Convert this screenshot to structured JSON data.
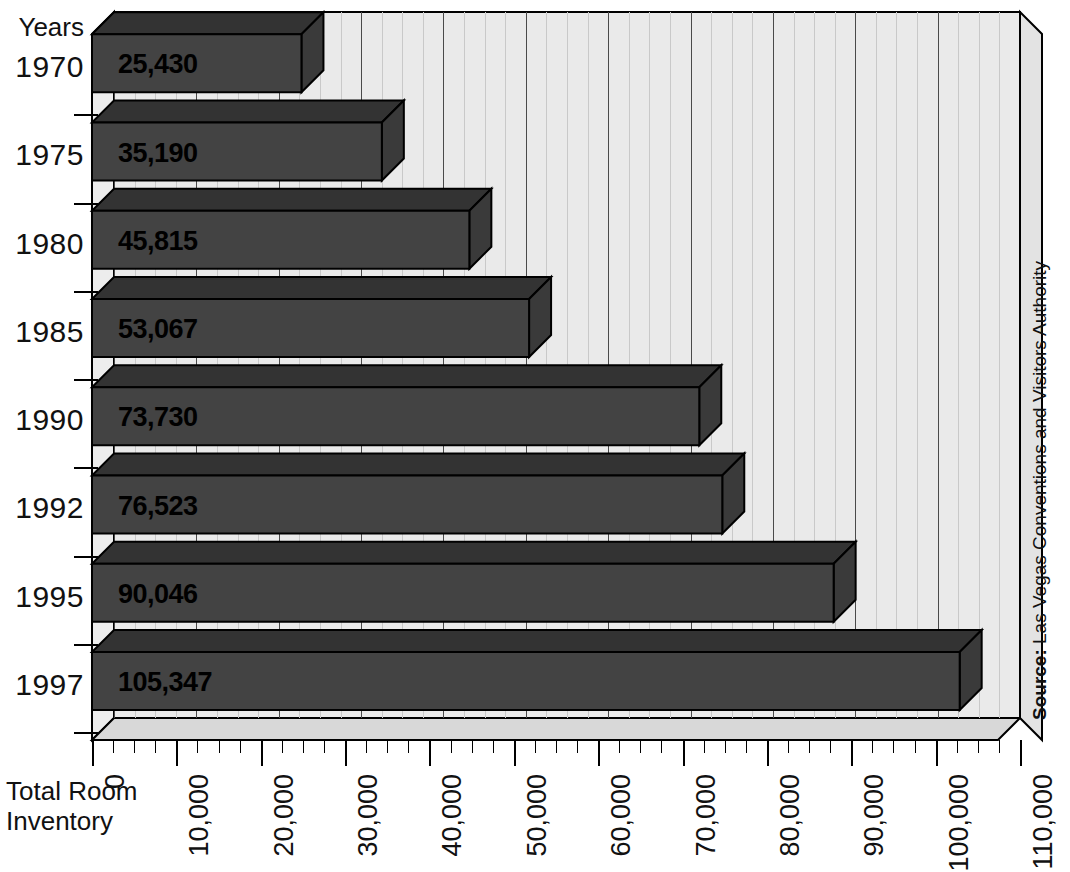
{
  "chart_data": {
    "type": "bar",
    "orientation": "horizontal",
    "title": "",
    "xlabel": "Total Room Inventory",
    "ylabel": "Years",
    "categories": [
      "1970",
      "1975",
      "1980",
      "1985",
      "1990",
      "1992",
      "1995",
      "1997"
    ],
    "values": [
      25430,
      35190,
      45815,
      53067,
      73730,
      76523,
      90046,
      105347
    ],
    "value_labels": [
      "25,430",
      "35,190",
      "45,815",
      "53,067",
      "73,730",
      "76,523",
      "90,046",
      "105,347"
    ],
    "xlim": [
      0,
      110000
    ],
    "xtick_labels": [
      "0",
      "10,000",
      "20,000",
      "30,000",
      "40,000",
      "50,000",
      "60,000",
      "70,000",
      "80,000",
      "90,000",
      "100,000",
      "110,000"
    ],
    "xticks": [
      0,
      10000,
      20000,
      30000,
      40000,
      50000,
      60000,
      70000,
      80000,
      90000,
      100000,
      110000
    ],
    "minor_ticks_per_interval": 4,
    "grid": true,
    "legend": null,
    "style": "3d-shaded-bars",
    "colors": {
      "bar_front": "#434343",
      "bar_top": "#333333",
      "plot_background": "#eaeaea",
      "axis": "#000000",
      "gridline_major": "#4a4a4a",
      "gridline_minor": "#c9c9c9"
    },
    "annotations": {
      "source_prefix": "Source:",
      "source_text": " Las Vegas Conventions and Visitors Authority"
    }
  },
  "axes": {
    "y_title": "Years",
    "x_title_line1": "Total Room",
    "x_title_line2": "Inventory"
  },
  "source": {
    "prefix": "Source:",
    "text": " Las Vegas Conventions and Visitors Authority"
  }
}
